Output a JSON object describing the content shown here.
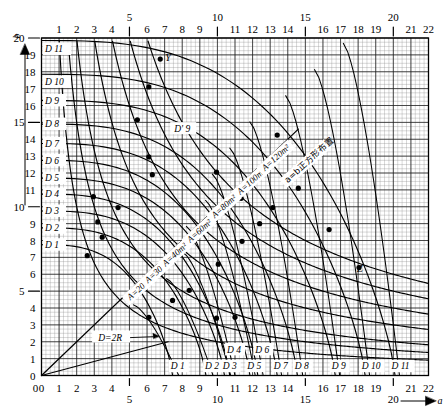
{
  "chart_data": {
    "type": "line",
    "title": "",
    "xlabel": "a",
    "ylabel": "b",
    "xlim": [
      0,
      22
    ],
    "ylim": [
      0,
      20
    ],
    "grid": true,
    "legend": "none",
    "x_ticks": [
      0,
      1,
      2,
      3,
      4,
      5,
      6,
      7,
      8,
      9,
      10,
      11,
      12,
      13,
      14,
      15,
      16,
      17,
      18,
      19,
      20,
      21,
      22
    ],
    "x_major_ticks": [
      5,
      10,
      15,
      20
    ],
    "y_ticks": [
      0,
      1,
      2,
      3,
      4,
      5,
      6,
      7,
      8,
      9,
      10,
      11,
      12,
      13,
      14,
      15,
      16,
      17,
      18,
      19,
      20
    ],
    "y_major_ticks": [
      5,
      10,
      15,
      20
    ],
    "x_axis_arrow_label": "a",
    "y_axis_arrow_label": "b",
    "annotations": [
      {
        "name": "square-layout-note",
        "text": "a=b正方形布置",
        "x": 14.0,
        "y": 11.4
      },
      {
        "name": "diameter-note",
        "text": "D=2R",
        "x": 3.9,
        "y": 2.25
      },
      {
        "name": "point-Y",
        "text": "Y",
        "x": 7.2,
        "y": 18.8
      },
      {
        "name": "point-Z",
        "text": "Z",
        "x": 18.1,
        "y": 6.35
      },
      {
        "name": "curve-label-Dprime9",
        "text": "D' 9",
        "x": 8.0,
        "y": 14.6
      }
    ],
    "area_curves": [
      {
        "label": "A=20m²",
        "value": 20,
        "unit": "m²",
        "lx": 5.05,
        "ly": 4.45
      },
      {
        "label": "A=30m²",
        "value": 30,
        "unit": "m²",
        "lx": 6.05,
        "ly": 5.45
      },
      {
        "label": "A=40m²",
        "value": 40,
        "unit": "m²",
        "lx": 7.05,
        "ly": 6.45
      },
      {
        "label": "A=60m²",
        "value": 60,
        "unit": "m²",
        "lx": 8.45,
        "ly": 7.85
      },
      {
        "label": "A=80m²",
        "value": 80,
        "unit": "m²",
        "lx": 9.85,
        "ly": 9.3
      },
      {
        "label": "A=100m²",
        "value": 100,
        "unit": "m²",
        "lx": 11.3,
        "ly": 10.7
      },
      {
        "label": "A=120m²",
        "value": 120,
        "unit": "m²",
        "lx": 12.7,
        "ly": 12.1
      }
    ],
    "left_axis_curve_labels": [
      {
        "label": "D 11",
        "y": 19.35
      },
      {
        "label": "D 10",
        "y": 17.4
      },
      {
        "label": "D 9",
        "y": 16.3
      },
      {
        "label": "D 8",
        "y": 14.9
      },
      {
        "label": "D 7",
        "y": 13.75
      },
      {
        "label": "D 6",
        "y": 12.75
      },
      {
        "label": "D 5",
        "y": 11.7
      },
      {
        "label": "D 4",
        "y": 10.75
      },
      {
        "label": "D 3",
        "y": 9.75
      },
      {
        "label": "D 2",
        "y": 8.75
      },
      {
        "label": "D 1",
        "y": 7.75
      }
    ],
    "bottom_curve_labels": [
      {
        "label": "D 1",
        "x": 7.35,
        "y": 0.55
      },
      {
        "label": "D 2",
        "x": 9.3,
        "y": 0.55
      },
      {
        "label": "D 3",
        "x": 10.3,
        "y": 0.55
      },
      {
        "label": "D 4",
        "x": 10.55,
        "y": 1.55
      },
      {
        "label": "D 5",
        "x": 11.7,
        "y": 0.55
      },
      {
        "label": "D 6",
        "x": 12.15,
        "y": 1.55
      },
      {
        "label": "D 7",
        "x": 13.2,
        "y": 0.55
      },
      {
        "label": "D 8",
        "x": 14.4,
        "y": 0.55
      },
      {
        "label": "D 9",
        "x": 16.5,
        "y": 0.55
      },
      {
        "label": "D 10",
        "x": 18.2,
        "y": 0.55
      },
      {
        "label": "D 11",
        "x": 19.9,
        "y": 0.55
      }
    ],
    "d_curves": [
      {
        "name": "D 1",
        "b0": 7.75,
        "marker": {
          "x": 2.6,
          "y": 7.1
        },
        "xend": 7.45
      },
      {
        "name": "D 2",
        "b0": 8.75,
        "marker": {
          "x": 3.45,
          "y": 8.2
        },
        "xend": 9.35
      },
      {
        "name": "D 3",
        "b0": 9.75,
        "marker": {
          "x": 3.2,
          "y": 9.1
        },
        "xend": 10.4
      },
      {
        "name": "D 4",
        "b0": 10.75,
        "marker": {
          "x": 2.95,
          "y": 10.6
        },
        "xend": 10.7
      },
      {
        "name": "D 5",
        "b0": 11.7,
        "marker": {
          "x": 4.35,
          "y": 9.95
        },
        "xend": 11.85
      },
      {
        "name": "D 6",
        "b0": 12.75,
        "marker": {
          "x": 6.1,
          "y": 12.95
        },
        "xend": 12.3
      },
      {
        "name": "D 7",
        "b0": 13.75,
        "marker": {
          "x": 6.3,
          "y": 11.9
        },
        "xend": 13.4
      },
      {
        "name": "D 8",
        "b0": 14.9,
        "marker": {
          "x": 5.45,
          "y": 15.15
        },
        "xend": 14.55
      },
      {
        "name": "D 9",
        "b0": 16.3,
        "marker": {
          "x": 6.1,
          "y": 17.1
        },
        "xend": 16.7
      },
      {
        "name": "D 10",
        "b0": 17.85,
        "marker": {
          "x": 6.75,
          "y": 18.75
        },
        "xend": 18.4
      },
      {
        "name": "D 11",
        "b0": 19.85,
        "marker": null,
        "xend": 20.1
      }
    ],
    "markers_on_area_curves": [
      {
        "x": 6.1,
        "y": 3.45
      },
      {
        "x": 7.45,
        "y": 4.45
      },
      {
        "x": 8.4,
        "y": 5.05
      },
      {
        "x": 9.95,
        "y": 3.4
      },
      {
        "x": 11.0,
        "y": 3.45
      },
      {
        "x": 10.05,
        "y": 6.6
      },
      {
        "x": 11.4,
        "y": 7.95
      },
      {
        "x": 12.4,
        "y": 9.0
      },
      {
        "x": 13.15,
        "y": 9.95
      },
      {
        "x": 14.6,
        "y": 11.1
      },
      {
        "x": 16.35,
        "y": 8.65
      },
      {
        "x": 18.05,
        "y": 6.4
      },
      {
        "x": 13.4,
        "y": 14.25
      },
      {
        "x": 9.95,
        "y": 12.05
      },
      {
        "x": 11.35,
        "y": 10.5
      }
    ]
  }
}
